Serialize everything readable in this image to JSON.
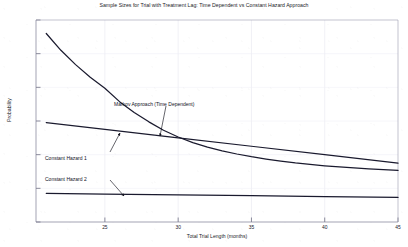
{
  "chart_data": {
    "type": "line",
    "title": "Sample Sizes for Trial with Treatment Lag: Time Dependent vs Constant Hazard Approach",
    "xlabel": "Total Trial Length (months)",
    "ylabel": "Probability",
    "xlim": [
      20.3,
      45
    ],
    "ylim": [
      0,
      12000
    ],
    "xticks": [
      20,
      25,
      30,
      35,
      40,
      45
    ],
    "xtick_labels": [
      "20",
      "25",
      "30",
      "35",
      "40",
      "45"
    ],
    "yticks": [
      0,
      2000,
      4000,
      6000,
      8000,
      10000,
      12000
    ],
    "ytick_labels": [
      "0",
      "2000",
      "4000",
      "6000",
      "8000",
      "10000",
      "12000"
    ],
    "grid": true,
    "legend_position": "none",
    "line_color": "#1a1a2e",
    "series": [
      {
        "name": "Markov Approach (Time Dependent)",
        "x": [
          21.0,
          22.0,
          23.0,
          24.0,
          25.0,
          26.0,
          27.0,
          28.0,
          29.0,
          30.0,
          31.0,
          32.0,
          33.0,
          34.0,
          35.0,
          36.0,
          37.0,
          38.0,
          39.0,
          40.0,
          41.0,
          42.0,
          43.0,
          44.0,
          45.0
        ],
        "y": [
          11200,
          10200,
          9350,
          8600,
          7950,
          7150,
          6500,
          5950,
          5450,
          5050,
          4720,
          4450,
          4230,
          4040,
          3880,
          3740,
          3620,
          3510,
          3420,
          3340,
          3270,
          3210,
          3155,
          3105,
          3060
        ]
      },
      {
        "name": "Constant Hazard 1",
        "x": [
          21.0,
          25.0,
          30.0,
          35.0,
          40.0,
          45.0
        ],
        "y": [
          5900,
          5500,
          5000,
          4500,
          4000,
          3500
        ]
      },
      {
        "name": "Constant Hazard 2",
        "x": [
          21.0,
          25.0,
          30.0,
          35.0,
          40.0,
          45.0
        ],
        "y": [
          1700,
          1660,
          1610,
          1560,
          1510,
          1460
        ]
      }
    ],
    "annotations": [
      {
        "text": "Markov Approach (Time Dependent)",
        "text_x": 114,
        "text_y": 101,
        "leader_from_x": 166,
        "leader_from_y": 106,
        "leader_to_x": 160,
        "leader_to_y": 136
      },
      {
        "text": "Constant Hazard 1",
        "text_x": 45,
        "text_y": 155,
        "leader_from_x": 110,
        "leader_from_y": 152,
        "leader_to_x": 120,
        "leader_to_y": 133
      },
      {
        "text": "Constant Hazard 2",
        "text_x": 45,
        "text_y": 176,
        "leader_from_x": 110,
        "leader_from_y": 180,
        "leader_to_x": 124,
        "leader_to_y": 196
      }
    ]
  }
}
